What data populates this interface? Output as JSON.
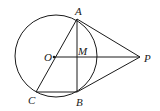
{
  "diagram": {
    "type": "geometry",
    "points": {
      "O": {
        "label": "O",
        "x": 55,
        "y": 57
      },
      "A": {
        "label": "A",
        "x": 77,
        "y": 19
      },
      "B": {
        "label": "B",
        "x": 77,
        "y": 90
      },
      "C": {
        "label": "C",
        "x": 37,
        "y": 91
      },
      "M": {
        "label": "M",
        "x": 77,
        "y": 57
      },
      "P": {
        "label": "P",
        "x": 140,
        "y": 57
      }
    },
    "circle": {
      "center": "O",
      "cx": 56,
      "cy": 56,
      "r": 41
    },
    "segments": [
      "PA",
      "PB",
      "OP",
      "AB",
      "AC",
      "CB"
    ]
  }
}
